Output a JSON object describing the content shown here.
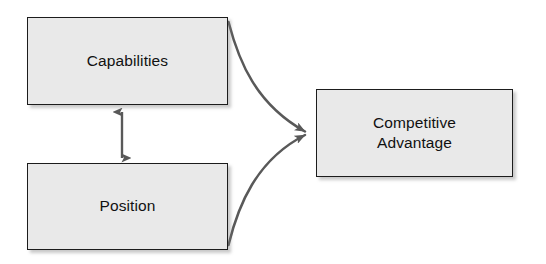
{
  "diagram": {
    "background_color": "#ffffff",
    "node_fill_color": "#e9e9e9",
    "node_border_color": "#1c1c1c",
    "connector_color": "#595959",
    "nodes": [
      {
        "id": "capabilities",
        "label": "Capabilities",
        "x": 27,
        "y": 17,
        "width": 201,
        "height": 88
      },
      {
        "id": "position",
        "label": "Position",
        "x": 27,
        "y": 163,
        "width": 201,
        "height": 87
      },
      {
        "id": "competitive-advantage",
        "label": "Competitive\nAdvantage",
        "x": 316,
        "y": 89,
        "width": 197,
        "height": 88
      }
    ],
    "connectors": [
      {
        "id": "capabilities-to-advantage",
        "from": "capabilities",
        "to": "competitive-advantage",
        "style": "curved",
        "arrowheads": "end"
      },
      {
        "id": "position-to-advantage",
        "from": "position",
        "to": "competitive-advantage",
        "style": "curved",
        "arrowheads": "end"
      },
      {
        "id": "capabilities-position-link",
        "from": "capabilities",
        "to": "position",
        "style": "straight-vertical",
        "arrowheads": "both"
      }
    ]
  }
}
